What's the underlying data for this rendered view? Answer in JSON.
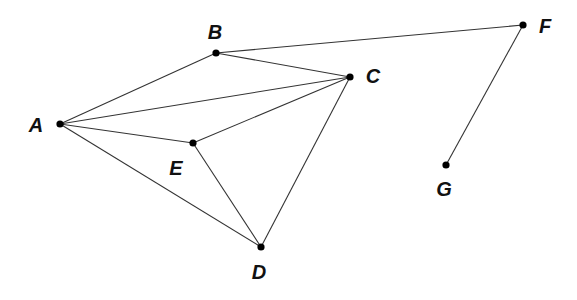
{
  "diagram": {
    "type": "graph",
    "nodes": [
      {
        "id": "A",
        "label": "A",
        "x": 60,
        "y": 124,
        "lx": 36,
        "ly": 132
      },
      {
        "id": "B",
        "label": "B",
        "x": 216,
        "y": 53,
        "lx": 215,
        "ly": 39
      },
      {
        "id": "C",
        "label": "C",
        "x": 350,
        "y": 77,
        "lx": 373,
        "ly": 83
      },
      {
        "id": "D",
        "label": "D",
        "x": 261,
        "y": 247,
        "lx": 259,
        "ly": 279
      },
      {
        "id": "E",
        "label": "E",
        "x": 193,
        "y": 143,
        "lx": 176,
        "ly": 175
      },
      {
        "id": "F",
        "label": "F",
        "x": 523,
        "y": 25,
        "lx": 545,
        "ly": 33
      },
      {
        "id": "G",
        "label": "G",
        "x": 446,
        "y": 165,
        "lx": 444,
        "ly": 196
      }
    ],
    "edges": [
      [
        "A",
        "B"
      ],
      [
        "A",
        "C"
      ],
      [
        "A",
        "E"
      ],
      [
        "A",
        "D"
      ],
      [
        "B",
        "C"
      ],
      [
        "B",
        "F"
      ],
      [
        "C",
        "E"
      ],
      [
        "C",
        "D"
      ],
      [
        "E",
        "D"
      ],
      [
        "F",
        "G"
      ]
    ]
  }
}
